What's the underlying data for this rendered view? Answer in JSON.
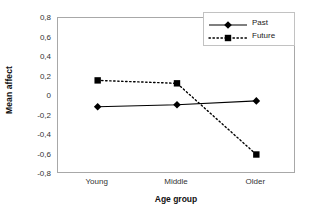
{
  "chart_data": {
    "type": "line",
    "title": "",
    "xlabel": "Age group",
    "ylabel": "Mean affect",
    "categories": [
      "Young",
      "Middle",
      "Older"
    ],
    "ylim": [
      -0.8,
      0.8
    ],
    "ytick_labels": [
      "0,8",
      "0,6",
      "0,4",
      "0,2",
      "0",
      "-0,2",
      "-0,4",
      "-0,6",
      "-0,8"
    ],
    "ytick_values": [
      0.8,
      0.6,
      0.4,
      0.2,
      0,
      -0.2,
      -0.4,
      -0.6,
      -0.8
    ],
    "grid": false,
    "legend_position": "top-right",
    "series": [
      {
        "name": "Past",
        "values": [
          -0.11,
          -0.09,
          -0.05
        ],
        "line_style": "solid",
        "marker": "diamond",
        "color": "#000000"
      },
      {
        "name": "Future",
        "values": [
          0.16,
          0.13,
          -0.6
        ],
        "line_style": "dotted",
        "marker": "square",
        "color": "#000000"
      }
    ]
  },
  "axes": {
    "y_title": "Mean affect",
    "x_title": "Age group"
  },
  "legend": {
    "entries": [
      {
        "label": "Past",
        "marker": "diamond-marker",
        "line": "solid-line"
      },
      {
        "label": "Future",
        "marker": "square-marker",
        "line": "dotted-line"
      }
    ]
  },
  "colors": {
    "series_line": "#000000",
    "plot_border": "#a8a8a8",
    "legend_border": "#c2c2c2",
    "background": "#ffffff",
    "text": "#333333"
  }
}
